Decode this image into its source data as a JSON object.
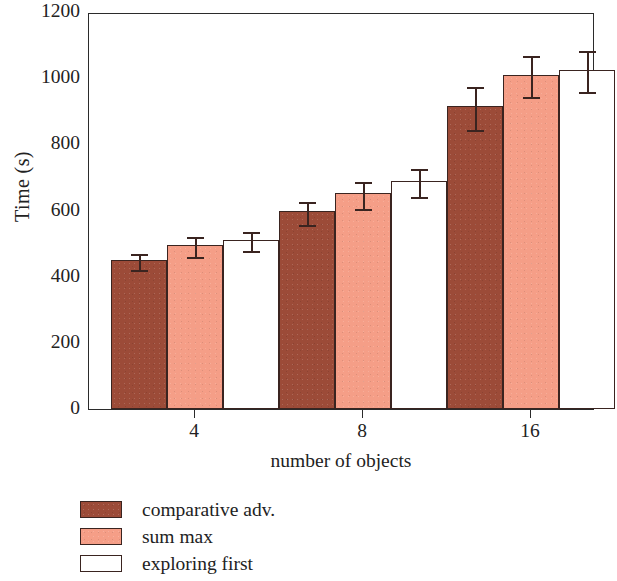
{
  "chart_data": {
    "type": "bar",
    "title": "",
    "xlabel": "number of objects",
    "ylabel": "Time (s)",
    "categories": [
      "4",
      "8",
      "16"
    ],
    "ylim": [
      0,
      1200
    ],
    "yticks": [
      0,
      200,
      400,
      600,
      800,
      1000,
      1200
    ],
    "ytick_labels": [
      "0",
      "200",
      "400",
      "600",
      "800",
      "1000",
      "1200"
    ],
    "grid": false,
    "legend_position": "below-left",
    "series": [
      {
        "name": "comparative adv.",
        "color": "#9c4b38",
        "values": [
          450,
          598,
          915
        ],
        "errors": [
          25,
          35,
          65
        ]
      },
      {
        "name": "sum max",
        "color": "#f59e87",
        "values": [
          495,
          652,
          1010
        ],
        "errors": [
          30,
          40,
          62
        ]
      },
      {
        "name": "exploring first",
        "color": "#ffffff",
        "values": [
          512,
          690,
          1025
        ],
        "errors": [
          28,
          42,
          62
        ]
      }
    ]
  },
  "axes": {
    "y_title": "Time (s)",
    "x_title": "number of objects",
    "y_tick_labels": [
      "1200",
      "1000",
      "800",
      "600",
      "400",
      "200",
      "0"
    ],
    "x_tick_labels": [
      "4",
      "8",
      "16"
    ]
  },
  "legend": {
    "items": [
      {
        "label": "comparative adv.",
        "swatch": "dark"
      },
      {
        "label": "sum max",
        "swatch": "salmon"
      },
      {
        "label": "exploring first",
        "swatch": "white"
      }
    ]
  },
  "colors": {
    "series_dark": "#9c4b38",
    "series_salmon": "#f59e87",
    "series_white": "#ffffff",
    "axis": "#2b2b2b",
    "text": "#222222",
    "background": "#ffffff"
  }
}
